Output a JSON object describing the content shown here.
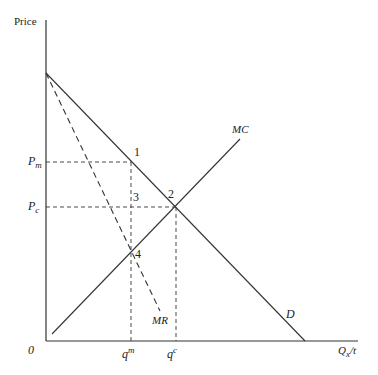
{
  "diagram": {
    "y_axis_label": "Price",
    "x_axis_label": {
      "main": "Q",
      "sub": "x",
      "suffix": "/t"
    },
    "origin_label": "0",
    "price_labels": [
      {
        "main": "P",
        "sub": "m"
      },
      {
        "main": "P",
        "sub": "c"
      }
    ],
    "quantity_labels": [
      {
        "main": "q",
        "sup": "m"
      },
      {
        "main": "q",
        "sup": "c"
      }
    ],
    "curves": [
      {
        "name": "D",
        "style": "solid"
      },
      {
        "name": "MR",
        "style": "dashed"
      },
      {
        "name": "MC",
        "style": "solid"
      }
    ],
    "points": [
      "1",
      "2",
      "3",
      "4"
    ],
    "colors": {
      "line": "#333333",
      "background": "#ffffff"
    }
  }
}
